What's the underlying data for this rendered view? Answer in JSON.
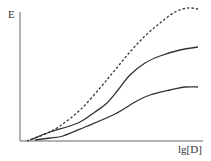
{
  "chart_data": {
    "type": "line",
    "title": "",
    "xlabel": "lg[D]",
    "ylabel": "E",
    "grid": false,
    "legend": null,
    "axis_ticks": "none",
    "series": [
      {
        "name": "dashed-curve",
        "style": "dashed",
        "points_px": [
          [
            27,
            141
          ],
          [
            45,
            134
          ],
          [
            60,
            126
          ],
          [
            80,
            110
          ],
          [
            100,
            88
          ],
          [
            115,
            70
          ],
          [
            130,
            52
          ],
          [
            145,
            36
          ],
          [
            160,
            23
          ],
          [
            175,
            12
          ],
          [
            188,
            8
          ],
          [
            198,
            9
          ]
        ]
      },
      {
        "name": "upper-solid-curve",
        "style": "solid",
        "points_px": [
          [
            30,
            140
          ],
          [
            50,
            132
          ],
          [
            78,
            123
          ],
          [
            95,
            112
          ],
          [
            107,
            103
          ],
          [
            118,
            90
          ],
          [
            130,
            75
          ],
          [
            145,
            63
          ],
          [
            160,
            56
          ],
          [
            180,
            50
          ],
          [
            198,
            47
          ]
        ]
      },
      {
        "name": "lower-solid-curve",
        "style": "solid",
        "points_px": [
          [
            35,
            140
          ],
          [
            50,
            138
          ],
          [
            63,
            136
          ],
          [
            85,
            127
          ],
          [
            115,
            114
          ],
          [
            135,
            102
          ],
          [
            150,
            95
          ],
          [
            170,
            90
          ],
          [
            185,
            87
          ],
          [
            198,
            87
          ]
        ]
      }
    ]
  },
  "labels": {
    "y_axis": "E",
    "x_axis": "lg[D]"
  },
  "colors": {
    "axis": "#555555",
    "curve": "#333333"
  }
}
